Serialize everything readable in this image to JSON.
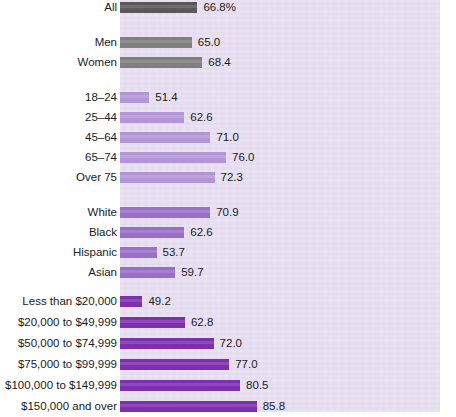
{
  "chart_data": {
    "type": "bar",
    "orientation": "horizontal",
    "title": "",
    "subtitle": "",
    "xlabel": "",
    "ylabel": "",
    "grid": false,
    "legend": "none",
    "axis_note": "truncated x-axis; bars begin at panel left edge, not at zero",
    "value_suffix_first_row": "%",
    "categories": [
      "All",
      "Men",
      "Women",
      "18–24",
      "25–44",
      "45–64",
      "65–74",
      "Over 75",
      "White",
      "Black",
      "Hispanic",
      "Asian",
      "Less than $20,000",
      "$20,000 to $49,999",
      "$50,000 to $74,999",
      "$75,000 to $99,999",
      "$100,000 to $149,999",
      "$150,000 and over"
    ],
    "values": [
      66.8,
      65.0,
      68.4,
      51.4,
      62.6,
      71.0,
      76.0,
      72.3,
      70.9,
      62.6,
      53.7,
      59.7,
      49.2,
      62.8,
      72.0,
      77.0,
      80.5,
      85.8
    ],
    "value_labels": [
      "66.8%",
      "65.0",
      "68.4",
      "51.4",
      "62.6",
      "71.0",
      "76.0",
      "72.3",
      "70.9",
      "62.6",
      "53.7",
      "59.7",
      "49.2",
      "62.8",
      "72.0",
      "77.0",
      "80.5",
      "85.8"
    ],
    "groups": [
      {
        "name": "total",
        "label": "All",
        "color": "#595959",
        "indices": [
          0
        ]
      },
      {
        "name": "sex",
        "label": "Sex",
        "color": "#7f7f7f",
        "indices": [
          1,
          2
        ]
      },
      {
        "name": "age",
        "label": "Age",
        "color": "#b296d8",
        "indices": [
          3,
          4,
          5,
          6,
          7
        ]
      },
      {
        "name": "race",
        "label": "Race",
        "color": "#9a6fc9",
        "indices": [
          8,
          9,
          10,
          11
        ]
      },
      {
        "name": "income",
        "label": "Income",
        "color": "#7c2fae",
        "indices": [
          12,
          13,
          14,
          15,
          16,
          17
        ]
      }
    ],
    "xlim": [
      42.0,
      89.0
    ]
  },
  "colors": {
    "panel_background": "#e5ddef",
    "page_background": "#ffffff",
    "text": "#1b1b1b",
    "bar_total": "#595959",
    "bar_sex": "#7f7f7f",
    "bar_age": "#b296d8",
    "bar_race": "#9a6fc9",
    "bar_income": "#7c2fae"
  },
  "rows": [
    {
      "label": "All",
      "value_label": "66.8%",
      "value": 66.8,
      "y": 13,
      "color_key": "bar_total"
    },
    {
      "label": "Men",
      "value_label": "65.0",
      "value": 65.0,
      "y": 48,
      "color_key": "bar_sex"
    },
    {
      "label": "Women",
      "value_label": "68.4",
      "value": 68.4,
      "y": 68,
      "color_key": "bar_sex"
    },
    {
      "label": "18–24",
      "value_label": "51.4",
      "value": 51.4,
      "y": 103,
      "color_key": "bar_age"
    },
    {
      "label": "25–44",
      "value_label": "62.6",
      "value": 62.6,
      "y": 123,
      "color_key": "bar_age"
    },
    {
      "label": "45–64",
      "value_label": "71.0",
      "value": 71.0,
      "y": 143,
      "color_key": "bar_age"
    },
    {
      "label": "65–74",
      "value_label": "76.0",
      "value": 76.0,
      "y": 163,
      "color_key": "bar_age"
    },
    {
      "label": "Over 75",
      "value_label": "72.3",
      "value": 72.3,
      "y": 183,
      "color_key": "bar_age"
    },
    {
      "label": "White",
      "value_label": "70.9",
      "value": 70.9,
      "y": 218,
      "color_key": "bar_race"
    },
    {
      "label": "Black",
      "value_label": "62.6",
      "value": 62.6,
      "y": 238,
      "color_key": "bar_race"
    },
    {
      "label": "Hispanic",
      "value_label": "53.7",
      "value": 53.7,
      "y": 258,
      "color_key": "bar_race"
    },
    {
      "label": "Asian",
      "value_label": "59.7",
      "value": 59.7,
      "y": 278,
      "color_key": "bar_race"
    },
    {
      "label": "Less than $20,000",
      "value_label": "49.2",
      "value": 49.2,
      "y": 307,
      "color_key": "bar_income"
    },
    {
      "label": "$20,000 to $49,999",
      "value_label": "62.8",
      "value": 62.8,
      "y": 328,
      "color_key": "bar_income"
    },
    {
      "label": "$50,000 to $74,999",
      "value_label": "72.0",
      "value": 72.0,
      "y": 349,
      "color_key": "bar_income"
    },
    {
      "label": "$75,000 to $99,999",
      "value_label": "77.0",
      "value": 77.0,
      "y": 370,
      "color_key": "bar_income"
    },
    {
      "label": "$100,000 to $149,999",
      "value_label": "80.5",
      "value": 80.5,
      "y": 391,
      "color_key": "bar_income"
    },
    {
      "label": "$150,000 and over",
      "value_label": "85.8",
      "value": 85.8,
      "y": 412,
      "color_key": "bar_income"
    }
  ],
  "geometry": {
    "bar_origin_x": 120,
    "px_per_unit": 3.12,
    "value_at_origin": 42.0,
    "bar_height": 11,
    "value_label_gap": 6,
    "panel_left": 120,
    "panel_width": 320,
    "panel_top": 0,
    "panel_height": 412
  }
}
